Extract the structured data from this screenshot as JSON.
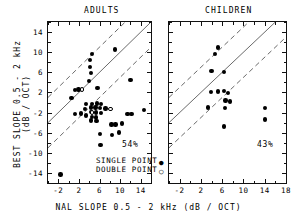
{
  "figure": {
    "y_axis_title": "BEST SLOPE 0.5 - 2 kHz (dB / OCT)",
    "y_axis_title_line1": "BEST SLOPE 0.5 - 2 kHz",
    "y_axis_title_line2": "(dB / OCT)",
    "x_axis_title": "NAL SLOPE 0.5 - 2 kHz (dB / OCT)"
  },
  "legend": {
    "single_label": "SINGLE POINT",
    "single_marker": "●",
    "double_label": "DOUBLE POINT",
    "double_marker": "○"
  },
  "chart_data": [
    {
      "type": "scatter",
      "title": "ADULTS",
      "xlabel": "NAL SLOPE 0.5 - 2 kHz (dB / OCT)",
      "ylabel": "BEST SLOPE 0.5 - 2 kHz (dB / OCT)",
      "xlim": [
        -4,
        16
      ],
      "ylim": [
        -16,
        16
      ],
      "xticks": [
        -2,
        2,
        6,
        10,
        14
      ],
      "yticks": [
        14,
        10,
        6,
        2,
        -2,
        -6,
        -10,
        -14
      ],
      "xtick_labels": [
        "-2",
        "2",
        "6",
        "10",
        "14"
      ],
      "ytick_labels": [
        "14",
        "10",
        "6",
        "2",
        "-2",
        "-6",
        "-10",
        "-14"
      ],
      "grid": false,
      "annotation": "54%",
      "annotation_meaning": "percent of points within dashed band",
      "reference_lines": [
        {
          "style": "solid",
          "slope": 1,
          "intercept": 0
        },
        {
          "style": "dashed",
          "slope": 1,
          "intercept": 5
        },
        {
          "style": "dashed",
          "slope": 1,
          "intercept": -5
        }
      ],
      "series": [
        {
          "name": "SINGLE POINT",
          "marker": "filled-circle",
          "points": [
            [
              9.0,
              10.5
            ],
            [
              4.5,
              9.6
            ],
            [
              4.2,
              8.4
            ],
            [
              4.2,
              7.1
            ],
            [
              4.3,
              5.9
            ],
            [
              4.0,
              4.3
            ],
            [
              1.9,
              2.6
            ],
            [
              1.2,
              2.5
            ],
            [
              5.6,
              2.9
            ],
            [
              12.0,
              4.5
            ],
            [
              0.6,
              0.9
            ],
            [
              3.4,
              -0.3
            ],
            [
              4.6,
              -0.3
            ],
            [
              5.5,
              -0.2
            ],
            [
              6.3,
              -0.3
            ],
            [
              4.3,
              -1.0
            ],
            [
              5.2,
              -1.0
            ],
            [
              6.1,
              -1.1
            ],
            [
              3.2,
              -1.3
            ],
            [
              7.2,
              -1.2
            ],
            [
              4.4,
              -1.9
            ],
            [
              5.3,
              -2.0
            ],
            [
              6.3,
              -2.1
            ],
            [
              11.4,
              -2.3
            ],
            [
              12.2,
              -2.3
            ],
            [
              14.6,
              -1.5
            ],
            [
              1.2,
              -2.3
            ],
            [
              2.4,
              -2.2
            ],
            [
              3.4,
              -2.6
            ],
            [
              4.5,
              -2.9
            ],
            [
              5.3,
              -3.0
            ],
            [
              4.4,
              -3.6
            ],
            [
              5.4,
              -3.7
            ],
            [
              8.3,
              -4.4
            ],
            [
              9.1,
              -4.4
            ],
            [
              10.4,
              -4.2
            ],
            [
              6.1,
              -6.3
            ],
            [
              8.4,
              -6.5
            ],
            [
              9.8,
              -6.0
            ],
            [
              6.2,
              -8.4
            ],
            [
              -1.6,
              -14.3
            ]
          ]
        },
        {
          "name": "DOUBLE POINT",
          "marker": "open-circle",
          "points": [
            [
              2.6,
              2.6
            ],
            [
              4.6,
              -2.0
            ],
            [
              8.1,
              -1.3
            ]
          ]
        }
      ]
    },
    {
      "type": "scatter",
      "title": "CHILDREN",
      "xlabel": "NAL SLOPE 0.5 - 2 kHz (dB / OCT)",
      "ylabel": "BEST SLOPE 0.5 - 2 kHz (dB / OCT)",
      "xlim": [
        -4,
        18
      ],
      "ylim": [
        -16,
        16
      ],
      "xticks": [
        -2,
        2,
        6,
        10,
        14,
        18
      ],
      "yticks": [
        14,
        10,
        6,
        2,
        -2,
        -6,
        -10,
        -14
      ],
      "xtick_labels": [
        "-2",
        "2",
        "6",
        "10",
        "14",
        "18"
      ],
      "ytick_labels": [
        "14",
        "10",
        "6",
        "2",
        "-2",
        "-6",
        "-10",
        "-14"
      ],
      "grid": false,
      "annotation": "43%",
      "annotation_meaning": "percent of points within dashed band",
      "reference_lines": [
        {
          "style": "solid",
          "slope": 1,
          "intercept": 0
        },
        {
          "style": "dashed",
          "slope": 1,
          "intercept": 5
        },
        {
          "style": "dashed",
          "slope": 1,
          "intercept": -5
        }
      ],
      "series": [
        {
          "name": "SINGLE POINT",
          "marker": "filled-circle",
          "points": [
            [
              5.2,
              10.9
            ],
            [
              4.6,
              9.6
            ],
            [
              4.0,
              6.3
            ],
            [
              6.4,
              6.1
            ],
            [
              3.9,
              2.1
            ],
            [
              5.2,
              2.2
            ],
            [
              6.4,
              2.3
            ],
            [
              7.1,
              1.9
            ],
            [
              6.6,
              0.4
            ],
            [
              7.5,
              0.2
            ],
            [
              3.3,
              -1.0
            ],
            [
              6.5,
              -1.1
            ],
            [
              14.0,
              -1.1
            ],
            [
              14.0,
              -3.4
            ],
            [
              6.3,
              -4.8
            ]
          ]
        },
        {
          "name": "DOUBLE POINT",
          "marker": "open-circle",
          "points": []
        }
      ]
    }
  ]
}
